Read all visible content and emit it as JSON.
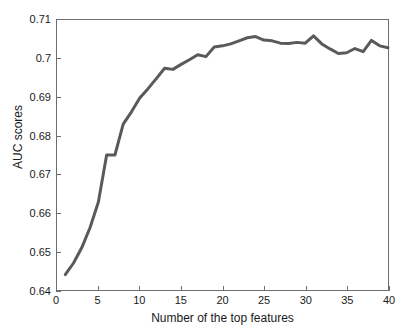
{
  "chart_data": {
    "type": "line",
    "title": "",
    "xlabel": "Number of the top features",
    "ylabel": "AUC scores",
    "xlim": [
      0,
      40
    ],
    "ylim": [
      0.64,
      0.71
    ],
    "xticks": [
      0,
      5,
      10,
      15,
      20,
      25,
      30,
      35,
      40
    ],
    "xticklabels": [
      "0",
      "5",
      "10",
      "15",
      "20",
      "25",
      "30",
      "35",
      "40"
    ],
    "yticks": [
      0.64,
      0.65,
      0.66,
      0.67,
      0.68,
      0.69,
      0.7,
      0.71
    ],
    "yticklabels": [
      "0.64",
      "0.65",
      "0.66",
      "0.67",
      "0.68",
      "0.69",
      "0.7",
      "0.71"
    ],
    "grid": false,
    "legend": null,
    "line_color": "#5a5a5a",
    "line_width": 3,
    "x": [
      1,
      2,
      3,
      4,
      5,
      6,
      7,
      8,
      9,
      10,
      11,
      12,
      13,
      14,
      15,
      16,
      17,
      18,
      19,
      20,
      21,
      22,
      23,
      24,
      25,
      26,
      27,
      28,
      29,
      30,
      31,
      32,
      33,
      34,
      35,
      36,
      37,
      38,
      39,
      40
    ],
    "y": [
      0.644,
      0.647,
      0.651,
      0.6562,
      0.6628,
      0.675,
      0.675,
      0.683,
      0.6862,
      0.6898,
      0.6922,
      0.6948,
      0.6975,
      0.6972,
      0.6985,
      0.6997,
      0.701,
      0.7005,
      0.703,
      0.7033,
      0.7038,
      0.7046,
      0.7054,
      0.7057,
      0.7048,
      0.7046,
      0.704,
      0.7039,
      0.7042,
      0.704,
      0.7059,
      0.7038,
      0.7025,
      0.7013,
      0.7015,
      0.7026,
      0.7018,
      0.7047,
      0.7033,
      0.7028
    ],
    "series": [
      {
        "name": "AUC",
        "values": [
          0.644,
          0.647,
          0.651,
          0.6562,
          0.6628,
          0.675,
          0.675,
          0.683,
          0.6862,
          0.6898,
          0.6922,
          0.6948,
          0.6975,
          0.6972,
          0.6985,
          0.6997,
          0.701,
          0.7005,
          0.703,
          0.7033,
          0.7038,
          0.7046,
          0.7054,
          0.7057,
          0.7048,
          0.7046,
          0.704,
          0.7039,
          0.7042,
          0.704,
          0.7059,
          0.7038,
          0.7025,
          0.7013,
          0.7015,
          0.7026,
          0.7018,
          0.7047,
          0.7033,
          0.7028
        ]
      }
    ]
  }
}
